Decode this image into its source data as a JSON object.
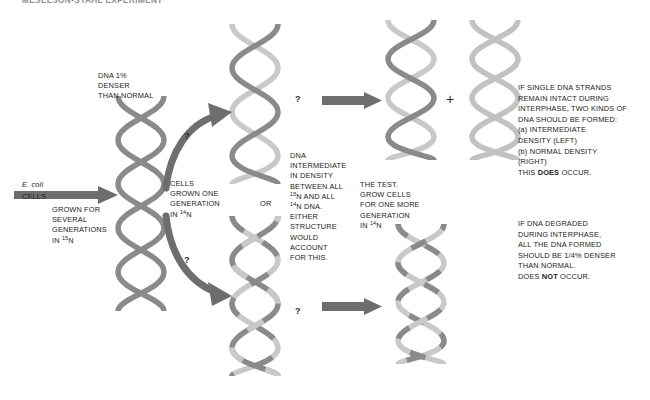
{
  "figure": {
    "title_partial": "MESELSON-STAHL EXPERIMENT",
    "domain": "Diagram"
  },
  "colors": {
    "heavy_strand": "#8a8a8a",
    "light_strand": "#c9c9c9",
    "arrow": "#6e6e6e",
    "arrow_dark": "#555555",
    "text": "#232323",
    "background": "#ffffff"
  },
  "labels": {
    "dna_denser": "DNA 1%\nDENSER\nTHAN NORMAL",
    "ecoli_italic": "E. coli",
    "ecoli_cells": "CELLS",
    "grown_several": "GROWN FOR\nSEVERAL\nGENERATIONS\nIN ",
    "grown_several_iso": "15",
    "grown_several_tail": "N",
    "cells_one_gen": "CELLS\nGROWN ONE\nGENERATION\nIN ",
    "cells_one_gen_iso": "14",
    "cells_one_gen_tail": "N",
    "or_label": "OR",
    "intermediate_line1": "DNA\nINTERMEDIATE\nIN DENSITY\nBETWEEN ALL\n",
    "intermediate_iso1": "15",
    "intermediate_mid": "N AND ALL\n",
    "intermediate_iso2": "14",
    "intermediate_tail": "N DNA.\nEITHER\nSTRUCTURE\nWOULD\nACCOUNT\nFOR THIS.",
    "the_test": "THE TEST.\nGROW CELLS\nFOR ONE MORE\nGENERATION\nIN ",
    "the_test_iso": "14",
    "the_test_tail": "N",
    "plus_sign": "+",
    "question_mark": "?"
  },
  "conclusions": {
    "semiconservative": {
      "body": "IF SINGLE DNA STRANDS\nREMAIN INTACT DURING\nINTERPHASE, TWO KINDS OF\nDNA SHOULD BE FORMED:\n(a) INTERMEDIATE\nDENSITY (LEFT)\n(b) NORMAL DENSITY\n(RIGHT)\nTHIS ",
      "emphasis": "DOES",
      "tail": " OCCUR."
    },
    "dispersive": {
      "body": "IF DNA DEGRADED\nDURING INTERPHASE,\nALL THE DNA FORMED\nSHOULD BE 1/4% DENSER\nTHAN NORMAL.\nDOES ",
      "emphasis": "NOT",
      "tail": " OCCUR."
    }
  },
  "helices": [
    {
      "id": "parent-heavy",
      "role": "parent DNA, both strands heavy (15N)"
    },
    {
      "id": "gen1-hybrid-top",
      "role": "first generation hybrid, one heavy one light strand"
    },
    {
      "id": "gen1-dispersive-bottom",
      "role": "first generation dispersive alternative, mixed segments"
    },
    {
      "id": "gen2-hybrid",
      "role": "second generation intermediate density"
    },
    {
      "id": "gen2-light",
      "role": "second generation normal density (all 14N)"
    },
    {
      "id": "gen2-dispersive",
      "role": "second generation dispersive prediction, mixed segments"
    }
  ]
}
